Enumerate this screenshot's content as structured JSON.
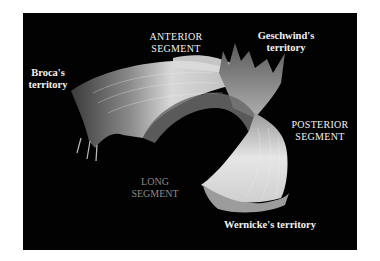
{
  "figure": {
    "background_color": "#020202",
    "labels": {
      "broca": {
        "line1": "Broca's",
        "line2": "territory"
      },
      "anterior": {
        "line1": "ANTERIOR",
        "line2": "SEGMENT"
      },
      "geschwind": {
        "line1": "Geschwind's",
        "line2": "territory"
      },
      "posterior": {
        "line1": "POSTERIOR",
        "line2": "SEGMENT"
      },
      "long": {
        "line1": "LONG",
        "line2": "SEGMENT"
      },
      "wernicke": {
        "line1": "Wernicke's territory"
      }
    }
  }
}
